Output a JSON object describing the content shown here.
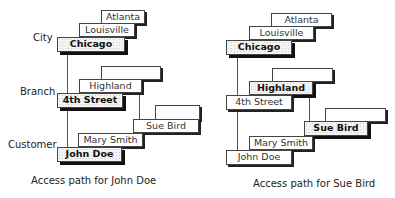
{
  "level_labels": {
    "city": "City",
    "branch": "Branch",
    "customer": "Customer"
  },
  "left": {
    "caption": "Access path for John Doe",
    "cities": [
      "Atlanta",
      "Louisville",
      "Chicago"
    ],
    "branches": [
      "",
      "Highland",
      "4th Street"
    ],
    "customers_upper": [
      "",
      "Sue Bird"
    ],
    "customers_lower": [
      "Mary Smith",
      "John Doe"
    ],
    "highlighted": [
      "Chicago",
      "4th Street",
      "John Doe"
    ]
  },
  "right": {
    "caption": "Access path for Sue Bird",
    "cities": [
      "Atlanta",
      "Louisville",
      "Chicago"
    ],
    "branches": [
      "",
      "Highland",
      "4th Street"
    ],
    "customers_upper": [
      "",
      "Sue Bird"
    ],
    "customers_lower": [
      "Mary Smith",
      "John Doe"
    ],
    "highlighted": [
      "Chicago",
      "Highland",
      "Sue Bird"
    ]
  }
}
